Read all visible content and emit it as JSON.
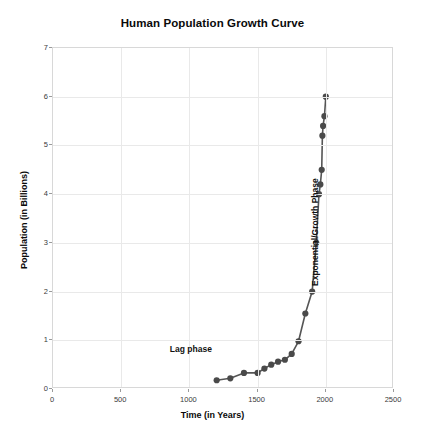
{
  "chart_data": {
    "type": "line",
    "title": "Human Population Growth Curve",
    "xlabel": "Time (in Years)",
    "ylabel": "Population (in Billions)",
    "xlim": [
      0,
      2500
    ],
    "ylim": [
      0,
      7
    ],
    "xticks": [
      0,
      500,
      1000,
      1500,
      2000,
      2500
    ],
    "yticks": [
      0,
      1,
      2,
      3,
      4,
      5,
      6,
      7
    ],
    "xtick_labels": [
      "0",
      "500",
      "1000",
      "1500",
      "2000",
      "2500"
    ],
    "ytick_labels": [
      "0",
      "1",
      "2",
      "3",
      "4",
      "5",
      "6",
      "7"
    ],
    "grid": true,
    "legend": null,
    "marker": "circle",
    "line_color": "#555555",
    "marker_color": "#4a4a4a",
    "grid_color": "#e9e9e9",
    "x": [
      1200,
      1300,
      1400,
      1500,
      1550,
      1600,
      1650,
      1700,
      1750,
      1800,
      1850,
      1900,
      1930,
      1950,
      1960,
      1970,
      1975,
      1980,
      1990,
      2000
    ],
    "y": [
      0.18,
      0.22,
      0.33,
      0.33,
      0.42,
      0.5,
      0.56,
      0.6,
      0.72,
      0.98,
      1.55,
      2.0,
      3.0,
      4.0,
      4.2,
      4.5,
      5.2,
      5.4,
      5.6,
      6.0
    ],
    "series": [
      {
        "name": "Human population",
        "x": [
          1200,
          1300,
          1400,
          1500,
          1550,
          1600,
          1650,
          1700,
          1750,
          1800,
          1850,
          1900,
          1930,
          1950,
          1960,
          1970,
          1975,
          1980,
          1990,
          2000
        ],
        "values": [
          0.18,
          0.22,
          0.33,
          0.33,
          0.42,
          0.5,
          0.56,
          0.6,
          0.72,
          0.98,
          1.55,
          2.0,
          3.0,
          4.0,
          4.2,
          4.5,
          5.2,
          5.4,
          5.6,
          6.0
        ]
      }
    ],
    "annotations": [
      {
        "text": "Lag phase",
        "x": 1260,
        "y": 0.78,
        "rotation": 0
      },
      {
        "text": "Exponential/Growth Phase",
        "x": 1890,
        "y": 2.1,
        "rotation": -90
      }
    ]
  }
}
